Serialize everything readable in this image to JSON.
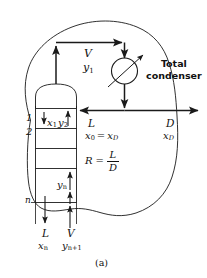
{
  "figure": {
    "caption": "(a)",
    "equipment": {
      "condenser_label_line1": "Total",
      "condenser_label_line2": "condenser"
    },
    "stages": {
      "first": "1",
      "second": "2",
      "last": "n"
    },
    "streams": {
      "overhead_vapor_flow": "V",
      "overhead_vapor_comp": "y",
      "overhead_vapor_comp_sub": "1",
      "reflux_flow": "L",
      "reflux_comp": "x",
      "reflux_comp_sub": "0",
      "reflux_comp_eq": "=",
      "reflux_comp_right": "x",
      "reflux_comp_right_sub": "D",
      "reflux_ratio_symbol": "R",
      "reflux_ratio_eq": "=",
      "reflux_ratio_num": "L",
      "reflux_ratio_den": "D",
      "distillate_flow": "D",
      "distillate_comp": "x",
      "distillate_comp_sub": "D",
      "liquid_stage1": "x",
      "liquid_stage1_sub": "1",
      "vapor_stage2": "y",
      "vapor_stage2_sub": "2",
      "vapor_stage_n": "y",
      "vapor_stage_n_sub": "n",
      "bottom_liquid_flow": "L",
      "bottom_liquid_comp": "x",
      "bottom_liquid_comp_sub": "n",
      "bottom_vapor_flow": "V",
      "bottom_vapor_comp": "y",
      "bottom_vapor_comp_sub": "n+1"
    },
    "colors": {
      "line": "#1a1a1a",
      "background": "#ffffff"
    }
  }
}
